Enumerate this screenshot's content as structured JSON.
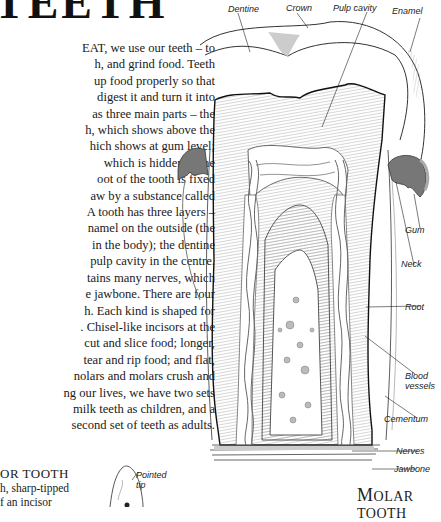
{
  "page": {
    "title": "TEETH",
    "body_lines": [
      "EAT, we use our teeth – to",
      "h, and grind food. Teeth",
      "up food properly so that",
      "digest it and turn it into",
      "as three main parts – the",
      "h, which shows above the",
      "hich shows at gum level;",
      "which is hidden in the",
      "oot of the tooth is fixed",
      "aw by a substance called",
      "A tooth has three layers –",
      "namel on the outside (the",
      "in the body); the dentine",
      "pulp cavity in the centre.",
      "tains many nerves, which",
      "e jawbone. There are four",
      "h. Each kind is shaped for",
      ". Chisel-like incisors at the",
      "cut and slice food; longer,",
      "tear and rip food; and flat,",
      "nolars and molars crush and",
      "ng our lives, we have two sets",
      "milk teeth as children, and a",
      "second set of teeth as adults."
    ],
    "incisor": {
      "title": "OR TOOTH",
      "lines": [
        "h, sharp-tipped",
        "f an incisor"
      ],
      "label_pointed_tip_1": "Pointed",
      "label_pointed_tip_2": "tip"
    }
  },
  "diagram": {
    "caption_initial": "M",
    "caption_rest": "OLAR TOOTH",
    "labels": {
      "dentine": "Dentine",
      "crown": "Crown",
      "pulp_cavity": "Pulp cavity",
      "enamel": "Enamel",
      "gum": "Gum",
      "neck": "Neck",
      "root": "Root",
      "blood_vessels_1": "Blood",
      "blood_vessels_2": "vessels",
      "cementum": "Cementum",
      "nerves": "Nerves",
      "jawbone": "Jawbone"
    }
  }
}
